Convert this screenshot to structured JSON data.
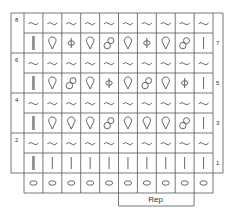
{
  "chart_title": "",
  "rows": [
    {
      "row": 8,
      "stitches": [
        "wave",
        "wave",
        "wave",
        "wave",
        "wave",
        "wave",
        "wave",
        "wave",
        "wave",
        "wave"
      ]
    },
    {
      "row": 7,
      "stitches": [
        "double-bar",
        "drop",
        "phi",
        "drop",
        "eight",
        "drop",
        "phi",
        "drop",
        "eight",
        "bar"
      ]
    },
    {
      "row": 6,
      "stitches": [
        "wave",
        "wave",
        "wave",
        "wave",
        "wave",
        "wave",
        "wave",
        "wave",
        "wave",
        "wave"
      ]
    },
    {
      "row": 5,
      "stitches": [
        "double-bar",
        "drop",
        "eight",
        "drop",
        "phi",
        "drop",
        "eight",
        "drop",
        "phi",
        "bar"
      ]
    },
    {
      "row": 4,
      "stitches": [
        "wave",
        "wave",
        "wave",
        "wave",
        "wave",
        "wave",
        "wave",
        "wave",
        "wave",
        "wave"
      ]
    },
    {
      "row": 3,
      "stitches": [
        "double-bar",
        "drop",
        "drop",
        "drop",
        "eight",
        "drop",
        "drop",
        "drop",
        "eight",
        "bar"
      ]
    },
    {
      "row": 2,
      "stitches": [
        "wave",
        "wave",
        "wave",
        "wave",
        "wave",
        "wave",
        "wave",
        "wave",
        "wave",
        "wave"
      ]
    },
    {
      "row": 1,
      "stitches": [
        "double-bar",
        "bar",
        "bar",
        "bar",
        "bar",
        "bar",
        "bar",
        "bar",
        "bar",
        "bar"
      ]
    },
    {
      "row": 0,
      "stitches": [
        "oval",
        "oval",
        "oval",
        "oval",
        "oval",
        "oval",
        "oval",
        "oval",
        "oval",
        "oval"
      ]
    }
  ],
  "left_labels": [
    "8",
    "6",
    "4",
    "2"
  ],
  "right_labels": [
    "7",
    "5",
    "3",
    "1"
  ],
  "repeat": {
    "label": "Rep",
    "start_col": 6,
    "end_col": 9
  },
  "colors": {
    "grid": "#555555",
    "symbol": "#555555",
    "double_bar": "#888888",
    "background": "#ffffff"
  }
}
